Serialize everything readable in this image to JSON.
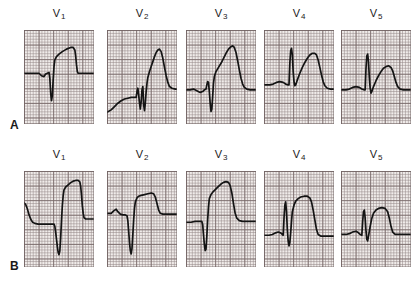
{
  "figure": {
    "rows": [
      {
        "id": "A",
        "label": "A",
        "panels": [
          {
            "lead": "V",
            "subscript": "1",
            "label": "V1",
            "trace": "M0,52 L14,52 L18,52 L21,55 L24,56 L26,53 L28,52 L30,51 L31,58 L32,76 L33,85 L34,79 L35,60 L36,44 L37,36 L39,32 L42,29 L46,26 L51,23 L56,21 L59,21 L61,24 L62,31 L63,42 L64,50 L65,52 L68,52 L84,52"
          },
          {
            "lead": "V",
            "subscript": "2",
            "label": "V2",
            "trace": "M0,99 L5,96 L9,92 L13,88 L17,85 L21,83 L25,82 L29,81 L33,81 L35,81 L36,74 L37,70 L38,78 L39,88 L40,95 L41,86 L42,72 L43,68 L43.5,78 L44,90 L45,97 L46,88 L47,74 L48,64 L49,57 L51,50 L53,44 L55,38 L57,32 L59,27 L61,24 L63,23 L65,26 L67,34 L69,45 L71,55 L73,63 L75,68 L78,70 L82,71 L84,71"
          },
          {
            "lead": "V",
            "subscript": "3",
            "label": "V3",
            "trace": "M0,72 L5,72 L9,71 L13,73 L17,75 L20,74 L22,72 L24,71 L25,66 L26,62 L27,63 L28,74 L29,88 L30,98 L31,95 L32,80 L33,64 L34,56 L36,50 L39,45 L42,40 L45,34 L48,28 L51,23 L54,20 L56,19 L58,21 L60,27 L62,37 L64,48 L66,58 L68,65 L70,69 L73,71 L77,72 L84,72"
          },
          {
            "lead": "V",
            "subscript": "4",
            "label": "V4",
            "trace": "M0,66 L7,66 L11,65 L15,63 L19,62 L23,63 L26,65 L29,66 L30,66 L31,40 L32,25 L33,22 L34,30 L35,50 L36,62 L37,67 L38,66 L40,60 L43,52 L46,45 L49,39 L52,34 L55,30 L58,28 L61,28 L63,30 L65,36 L67,45 L69,54 L71,62 L73,67 L76,70 L80,71 L84,71"
          },
          {
            "lead": "V",
            "subscript": "5",
            "label": "V5",
            "trace": "M0,72 L6,72 L10,71 L14,69 L18,68 L22,69 L25,71 L28,72 L29,72 L30,46 L31,31 L32,29 L33,38 L34,57 L35,70 L36,76 L37,74 L39,68 L42,61 L45,55 L48,50 L51,46 L54,44 L57,43 L60,45 L62,49 L64,56 L66,63 L68,68 L71,71 L75,72 L84,72"
          }
        ]
      },
      {
        "id": "B",
        "label": "B",
        "panels": [
          {
            "lead": "V",
            "subscript": "1",
            "label": "V1",
            "trace": "M0,44 L2,46 L4,52 L6,60 L8,66 L10,70 L13,72 L17,73 L22,73 L28,73 L33,73 L36,73 L37,76 L38,84 L39,94 L40,104 L41,112 L42,115 L43,110 L44,92 L45,68 L46,48 L47,34 L48,26 L50,22 L53,19 L56,16 L59,14 L62,13 L65,13 L67,15 L68,21 L69,33 L70,48 L71,58 L72,64 L74,66 L78,66 L84,66"
          },
          {
            "lead": "V",
            "subscript": "2",
            "label": "V2",
            "trace": "M0,52 L5,52 L8,49 L11,47 L13,50 L16,53 L19,54 L22,54 L24,55 L25,61 L26,74 L27,88 L28,98 L29,102 L30,95 L31,78 L32,60 L33,46 L34,38 L36,33 L38,31 L41,30 L45,29 L49,28 L53,27 L56,28 L58,32 L60,40 L62,48 L64,52 L67,53 L72,53 L78,53 L84,53"
          },
          {
            "lead": "V",
            "subscript": "3",
            "label": "V3",
            "trace": "M0,63 L6,63 L11,62 L16,62 L19,62 L20,66 L21,78 L22,90 L23,98 L24,96 L25,80 L26,60 L27,44 L28,34 L30,29 L33,25 L36,22 L39,19 L42,16 L45,14 L48,13 L51,14 L53,18 L55,27 L57,40 L59,52 L61,58 L64,61 L68,62 L74,62 L84,62"
          },
          {
            "lead": "V",
            "subscript": "4",
            "label": "V4",
            "trace": "M0,79 L6,79 L10,78 L14,76 L17,75 L20,76 L22,78 L23,79 L24,58 L25,42 L26,38 L27,50 L28,72 L29,86 L30,92 L31,88 L32,76 L33,62 L34,50 L36,42 L38,37 L41,34 L44,32 L48,31 L52,31 L55,33 L57,38 L59,48 L61,60 L63,72 L65,78 L68,80 L73,80 L84,80"
          },
          {
            "lead": "V",
            "subscript": "5",
            "label": "V5",
            "trace": "M0,78 L6,78 L10,77 L14,75 L18,74 L21,76 L23,78 L25,79 L26,62 L27,50 L28,48 L29,58 L30,74 L31,84 L32,86 L33,80 L35,68 L37,58 L39,52 L42,48 L45,46 L49,45 L53,46 L56,50 L58,58 L60,68 L62,75 L65,78 L70,78 L84,78"
          }
        ]
      }
    ]
  }
}
